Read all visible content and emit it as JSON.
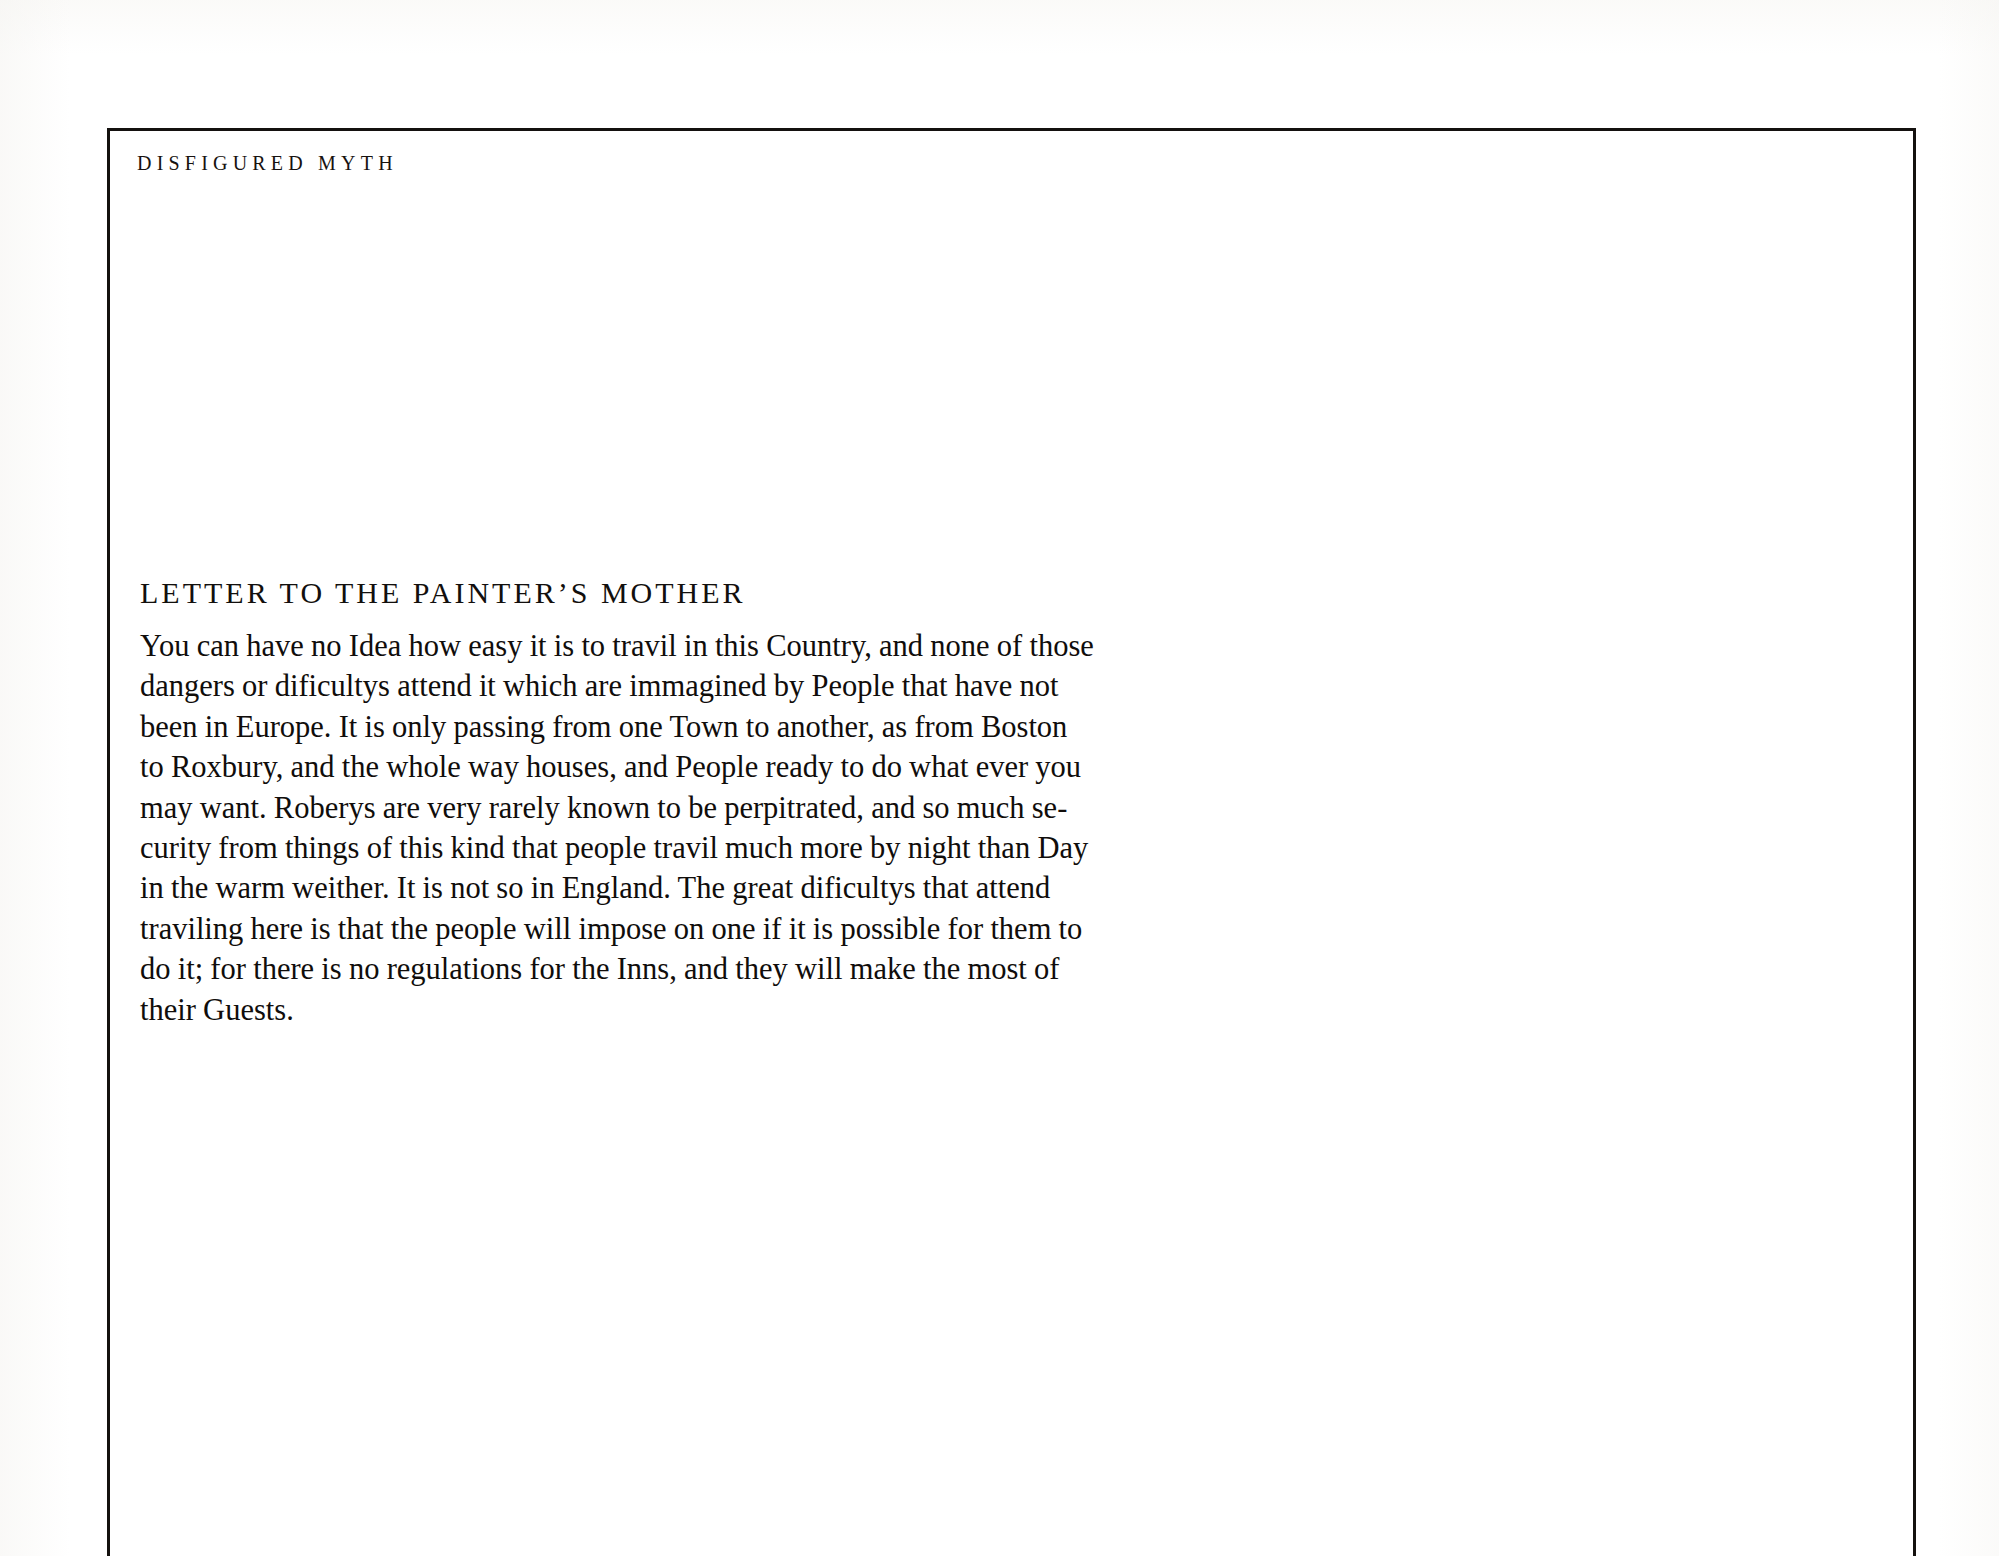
{
  "page": {
    "running_head": "DISFIGURED MYTH",
    "background_color": "#ffffff",
    "ink_color": "#100d0b",
    "rule_color": "#14110f"
  },
  "section": {
    "title": "LETTER TO THE PAINTER’S MOTHER",
    "body_lines": [
      "You can have no Idea how easy it is to travil in this Country, and none of those",
      "dangers or dificultys attend it which are immagined by People that have not",
      "been in Europe. It is only passing from one Town to another, as from Boston",
      "to Roxbury, and the whole way houses, and People ready to do what ever you",
      "may want. Roberys are very rarely known to be perpitrated, and so much se-",
      "curity from things of this kind that people travil much more by night than Day",
      "in the warm weither. It is not so in England. The great dificultys that attend",
      "traviling here is that the people will impose on one if it is possible for them to",
      "do it; for there is no regulations for the Inns, and they will make the most of",
      "their Guests."
    ]
  }
}
